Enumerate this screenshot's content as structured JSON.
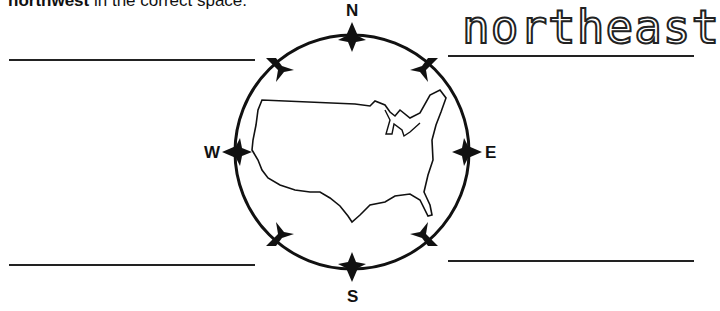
{
  "instruction": {
    "bold": "northwest",
    "rest": " in the correct space."
  },
  "answers": {
    "northeast": "northeast",
    "northwest": "",
    "southwest": "",
    "southeast": ""
  },
  "compass": {
    "north": "N",
    "south": "S",
    "east": "E",
    "west": "W"
  },
  "map": {
    "label": "United States outline"
  }
}
